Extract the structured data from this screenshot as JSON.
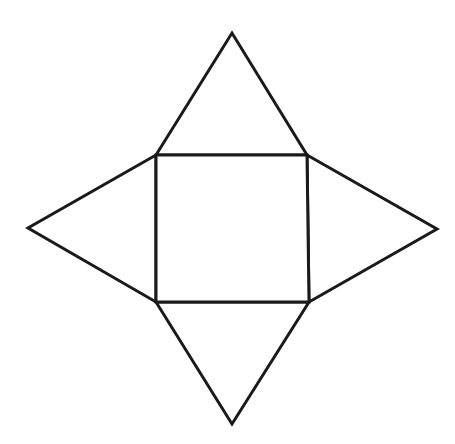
{
  "diagram": {
    "type": "net-of-square-pyramid",
    "stroke_color": "#1a1a1a",
    "background": "#ffffff",
    "square_base": {
      "points": [
        [
          156,
          155
        ],
        [
          307,
          155
        ],
        [
          309,
          302
        ],
        [
          156,
          302
        ]
      ]
    },
    "triangles": {
      "top": {
        "points": [
          [
            156,
            155
          ],
          [
            232,
            33
          ],
          [
            307,
            155
          ]
        ]
      },
      "right": {
        "points": [
          [
            307,
            155
          ],
          [
            437,
            229
          ],
          [
            309,
            302
          ]
        ]
      },
      "bottom": {
        "points": [
          [
            156,
            302
          ],
          [
            232,
            424
          ],
          [
            309,
            302
          ]
        ]
      },
      "left": {
        "points": [
          [
            156,
            155
          ],
          [
            28,
            228
          ],
          [
            156,
            302
          ]
        ]
      }
    }
  }
}
